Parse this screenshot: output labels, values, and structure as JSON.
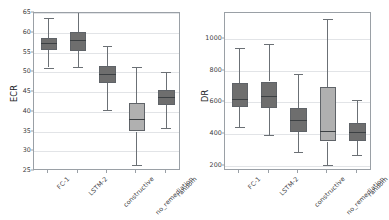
{
  "figure": {
    "background": "#ffffff",
    "box_dark_color": "#6e6e6e",
    "box_light_color": "#b0b0b0",
    "box_edge_color": "#5f6368",
    "grid_color": "#e2e4e7",
    "frame_color": "#9aa0a6"
  },
  "chart_data": [
    {
      "type": "box",
      "panel": "left",
      "title": "",
      "xlabel": "",
      "ylabel": "ECR",
      "ylim": [
        25,
        65
      ],
      "yticks": [
        25,
        30,
        35,
        40,
        45,
        50,
        55,
        60,
        65
      ],
      "grid": true,
      "legend": "none",
      "categories": [
        "FC-1",
        "LSTM-2",
        "constructive",
        "no_remediation",
        "random"
      ],
      "boxes": [
        {
          "label": "FC-1",
          "whisker_low": 51.2,
          "q1": 55.7,
          "median": 57.3,
          "q3": 58.6,
          "whisker_high": 63.8,
          "color": "#6e6e6e"
        },
        {
          "label": "LSTM-2",
          "whisker_low": 51.4,
          "q1": 55.5,
          "median": 58.3,
          "q3": 60.2,
          "whisker_high": 65.3,
          "color": "#6e6e6e"
        },
        {
          "label": "constructive",
          "whisker_low": 40.5,
          "q1": 47.2,
          "median": 49.6,
          "q3": 51.5,
          "whisker_high": 56.6,
          "color": "#6e6e6e"
        },
        {
          "label": "no_remediation",
          "whisker_low": 26.6,
          "q1": 35.0,
          "median": 38.2,
          "q3": 42.2,
          "whisker_high": 51.4,
          "color": "#b0b0b0"
        },
        {
          "label": "random",
          "whisker_low": 36.0,
          "q1": 41.7,
          "median": 43.8,
          "q3": 45.5,
          "whisker_high": 50.0,
          "color": "#6e6e6e"
        }
      ]
    },
    {
      "type": "box",
      "panel": "right",
      "title": "",
      "xlabel": "",
      "ylabel": "DR",
      "ylim": [
        170,
        1160
      ],
      "yticks": [
        200,
        400,
        600,
        800,
        1000
      ],
      "grid": true,
      "legend": "none",
      "categories": [
        "FC-1",
        "LSTM-2",
        "constructive",
        "no_remediation",
        "random"
      ],
      "boxes": [
        {
          "label": "FC-1",
          "whisker_low": 447,
          "q1": 570,
          "median": 622,
          "q3": 722,
          "whisker_high": 940,
          "color": "#6e6e6e"
        },
        {
          "label": "LSTM-2",
          "whisker_low": 397,
          "q1": 565,
          "median": 641,
          "q3": 731,
          "whisker_high": 965,
          "color": "#6e6e6e"
        },
        {
          "label": "constructive",
          "whisker_low": 288,
          "q1": 416,
          "median": 487,
          "q3": 566,
          "whisker_high": 780,
          "color": "#6e6e6e"
        },
        {
          "label": "no_remediation",
          "whisker_low": 210,
          "q1": 355,
          "median": 421,
          "q3": 697,
          "whisker_high": 1120,
          "color": "#b0b0b0"
        },
        {
          "label": "random",
          "whisker_low": 270,
          "q1": 360,
          "median": 412,
          "q3": 470,
          "whisker_high": 618,
          "color": "#6e6e6e"
        }
      ]
    }
  ]
}
